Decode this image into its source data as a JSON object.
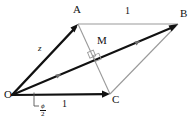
{
  "figure": {
    "type": "geometry-diagram",
    "background_color": "#ffffff",
    "bold_stroke_color": "#111111",
    "thin_stroke_color": "#9a9a9a"
  },
  "points": {
    "O": {
      "label": "O",
      "x": 12,
      "y": 95,
      "label_x": 4,
      "label_y": 95
    },
    "A": {
      "label": "A",
      "x": 78,
      "y": 24,
      "label_x": 74,
      "label_y": 6
    },
    "B": {
      "label": "B",
      "x": 178,
      "y": 24,
      "label_x": 181,
      "label_y": 10
    },
    "C": {
      "label": "C",
      "x": 110,
      "y": 94,
      "label_x": 112,
      "label_y": 96
    },
    "M": {
      "label": "M",
      "x": 96,
      "y": 56,
      "label_x": 98,
      "label_y": 37
    }
  },
  "labels": {
    "side_z": "z",
    "side_top_one": "1",
    "side_bottom_one": "1",
    "angle_numerator": "ϕ",
    "angle_denominator": "2"
  },
  "edges": [
    {
      "name": "O-to-A",
      "from": "O",
      "to": "A",
      "style": "bold-arrow",
      "length_label": "z"
    },
    {
      "name": "O-to-B",
      "from": "O",
      "to": "B",
      "style": "bold-arrow",
      "length_label": ""
    },
    {
      "name": "O-to-C",
      "from": "O",
      "to": "C",
      "style": "bold-arrow",
      "length_label": "1"
    },
    {
      "name": "A-to-B",
      "from": "A",
      "to": "B",
      "style": "thin",
      "length_label": "1"
    },
    {
      "name": "A-to-C",
      "from": "A",
      "to": "C",
      "style": "thin",
      "length_label": ""
    },
    {
      "name": "C-to-B",
      "from": "C",
      "to": "B",
      "style": "thin",
      "length_label": ""
    }
  ],
  "markers": {
    "right_angle_at_M": true,
    "angle_phi_over_2_at_O": true
  }
}
